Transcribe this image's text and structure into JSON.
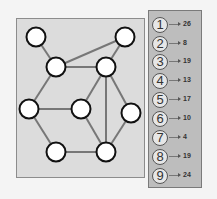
{
  "colors": {
    "page_bg": "#f4f4f4",
    "graph_panel_bg": "#dcdcdc",
    "legend_panel_bg": "#bdbdbd",
    "node_fill": "#ffffff",
    "node_stroke": "#111111",
    "edge_color": "#777777"
  },
  "graph": {
    "nodes": [
      {
        "id": "A",
        "x": 36,
        "y": 37
      },
      {
        "id": "B",
        "x": 125,
        "y": 37
      },
      {
        "id": "C",
        "x": 56,
        "y": 67
      },
      {
        "id": "D",
        "x": 106,
        "y": 67
      },
      {
        "id": "E",
        "x": 29,
        "y": 109
      },
      {
        "id": "F",
        "x": 81,
        "y": 109
      },
      {
        "id": "G",
        "x": 131,
        "y": 113
      },
      {
        "id": "H",
        "x": 56,
        "y": 152
      },
      {
        "id": "I",
        "x": 106,
        "y": 152
      }
    ],
    "edges": [
      [
        "A",
        "C"
      ],
      [
        "C",
        "B"
      ],
      [
        "C",
        "D"
      ],
      [
        "B",
        "D"
      ],
      [
        "C",
        "E"
      ],
      [
        "D",
        "F"
      ],
      [
        "D",
        "I"
      ],
      [
        "D",
        "G"
      ],
      [
        "E",
        "F"
      ],
      [
        "E",
        "H"
      ],
      [
        "H",
        "I"
      ],
      [
        "F",
        "I"
      ],
      [
        "G",
        "I"
      ]
    ]
  },
  "legend": {
    "items": [
      {
        "label": "1",
        "value": "26"
      },
      {
        "label": "2",
        "value": "8"
      },
      {
        "label": "3",
        "value": "19"
      },
      {
        "label": "4",
        "value": "13"
      },
      {
        "label": "5",
        "value": "17"
      },
      {
        "label": "6",
        "value": "10"
      },
      {
        "label": "7",
        "value": "4"
      },
      {
        "label": "8",
        "value": "19"
      },
      {
        "label": "9",
        "value": "24"
      }
    ]
  }
}
